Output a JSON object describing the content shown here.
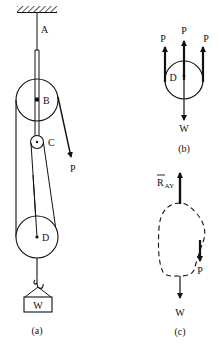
{
  "figure_a": {
    "caption": "(a)",
    "support_label": "A",
    "pulley_upper_label": "B",
    "pulley_small_label": "C",
    "pulley_lower_label": "D",
    "force_label": "P",
    "weight_label": "W"
  },
  "figure_b": {
    "caption": "(b)",
    "pulley_label": "D",
    "force_left_label": "P",
    "force_center_label": "P",
    "force_right_label": "P",
    "weight_label": "W"
  },
  "figure_c": {
    "caption": "(c)",
    "reaction_label_main": "R",
    "reaction_label_sub": "AY",
    "force_label": "P",
    "weight_label": "W"
  },
  "colors": {
    "ink": "#111111",
    "background": "#ffffff"
  }
}
